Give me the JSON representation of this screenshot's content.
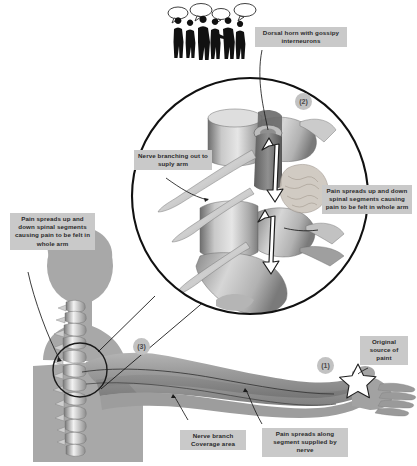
{
  "figure": {
    "background": "#ffffff",
    "callout_bg": "#c9c9c9",
    "marker_bg": "#c2c2c2",
    "ink": "#1a1a1a"
  },
  "callouts": {
    "dorsal_horn": "Dorsal horn with gossipy interneurons",
    "nerve_branching": "Nerve branching out to suply arm",
    "pain_spreads_right": "Pain spreads up and down spinal segments causing pain to be felt in whole arm",
    "pain_spreads_left": "Pain spreads up and down spinal segments causing pain to be felt in whole arm",
    "original_source": "Original source of paint",
    "nerve_branch_coverage": "Nerve branch Coverage area",
    "pain_along_segment": "Pain spreads along segment supplied by nerve"
  },
  "markers": {
    "one": "(1)",
    "two": "(2)",
    "three": "(3)"
  },
  "icons": {
    "crowd": "crowd-silhouette-icon",
    "speech_bubbles": "speech-bubble-icon",
    "star": "star-icon",
    "magnifier_circle": "magnifier-circle-icon",
    "vertebrae": "vertebrae-illustration",
    "body": "body-silhouette",
    "arm": "arm-illustration",
    "spine": "cervical-spine-illustration",
    "arrow_up_down": "double-arrow-icon"
  }
}
